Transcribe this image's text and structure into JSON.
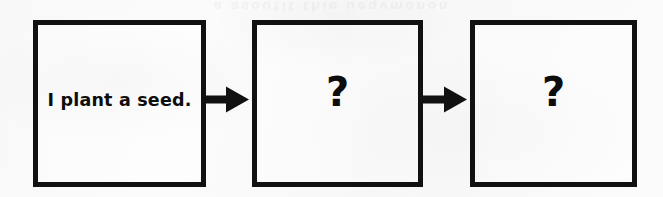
{
  "page": {
    "kind": "scanned-worksheet-sequence-diagram",
    "background_color": "#fbfbfb",
    "ink_color": "#111111"
  },
  "artifacts": {
    "bleed_through_text": "a asoutit thie ueqvmonon"
  },
  "diagram": {
    "type": "left-to-right-sequence",
    "steps": [
      {
        "id": "step-1",
        "kind": "statement",
        "text": "I plant a seed."
      },
      {
        "id": "step-2",
        "kind": "unknown",
        "text": "?"
      },
      {
        "id": "step-3",
        "kind": "unknown",
        "text": "?"
      }
    ],
    "connectors": [
      {
        "id": "connector-1",
        "glyph": "arrow-right",
        "from": "step-1",
        "to": "step-2"
      },
      {
        "id": "connector-2",
        "glyph": "arrow-right",
        "from": "step-2",
        "to": "step-3"
      }
    ]
  }
}
